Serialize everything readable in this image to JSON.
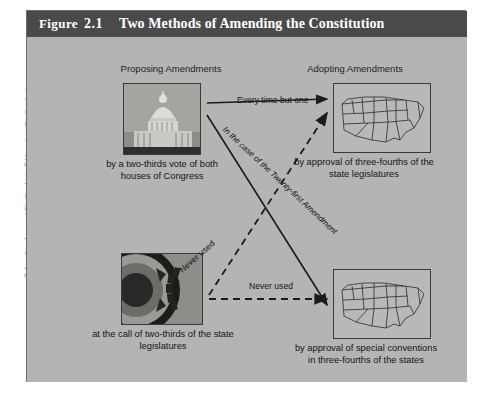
{
  "figure": {
    "label": "Figure",
    "number": "2.1",
    "title": "Two Methods of Amending the Constitution"
  },
  "columns": {
    "left_heading": "Proposing Amendments",
    "right_heading": "Adopting Amendments"
  },
  "nodes": [
    {
      "id": "congress",
      "image": "us-capitol-dome-photo",
      "caption": "by a two-thirds vote of both houses of Congress"
    },
    {
      "id": "state-legislatures-call",
      "image": "gear-cog-photo",
      "caption": "at the call of two-thirds of the state legislatures"
    },
    {
      "id": "state-legislatures-approval",
      "image": "united-states-map",
      "caption": "by approval of three-fourths of the state legislatures"
    },
    {
      "id": "state-conventions",
      "image": "united-states-map",
      "caption": "by approval of special conventions in three-fourths of the states"
    }
  ],
  "connectors": [
    {
      "id": "congress-to-legislatures",
      "label": "Every time but one",
      "style": "solid"
    },
    {
      "id": "congress-to-conventions",
      "label": "In the case of the Twenty-first Amendment",
      "style": "solid"
    },
    {
      "id": "state-call-to-legislatures",
      "label": "Never used",
      "style": "dashed"
    },
    {
      "id": "state-call-to-conventions",
      "label": "Never used",
      "style": "dashed"
    }
  ],
  "credit": {
    "line1": "© Jonathan Larsen / Shutterstock; © Vospalej / Shutterstock;",
    "line2": "© 3pod Animation / Shutterstock"
  },
  "colors": {
    "title_bar": "#4a4a4a",
    "canvas": "#b4b4b4",
    "frame_border": "#6f6f6f",
    "text": "#141414",
    "credit_text": "#6d6d6d"
  }
}
